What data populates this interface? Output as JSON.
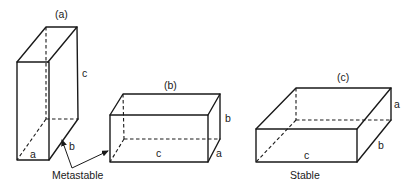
{
  "figure": {
    "boxes": [
      {
        "id": "a",
        "panel_label": "(a)",
        "dimension_labels": {
          "vertical": "c",
          "depth": "b",
          "width": "a"
        }
      },
      {
        "id": "b",
        "panel_label": "(b)",
        "dimension_labels": {
          "vertical": "b",
          "depth": "a",
          "width": "c"
        }
      },
      {
        "id": "c",
        "panel_label": "(c)",
        "dimension_labels": {
          "vertical": "a",
          "depth": "b",
          "width": "c"
        }
      }
    ],
    "captions": {
      "metastable": "Metastable",
      "stable": "Stable"
    },
    "colors": {
      "line": "#1a1a1a",
      "background": "#ffffff"
    }
  }
}
